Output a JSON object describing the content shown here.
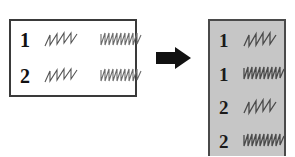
{
  "diagram": {
    "background_color": "#ffffff"
  },
  "source_box": {
    "name": "source-table",
    "fill_color": "#ffffff",
    "border_color": "#3a3a3a",
    "rows": [
      {
        "label": "1",
        "waveforms": [
          {
            "kind": "sawtooth-sparse",
            "cycles": 2.5,
            "stroke_color": "#555555"
          },
          {
            "kind": "sawtooth-dense",
            "cycles": 5,
            "stroke_color": "#6b6b6b"
          }
        ]
      },
      {
        "label": "2",
        "waveforms": [
          {
            "kind": "sawtooth-sparse",
            "cycles": 2.5,
            "stroke_color": "#555555"
          },
          {
            "kind": "sawtooth-dense",
            "cycles": 5,
            "stroke_color": "#6b6b6b"
          }
        ]
      }
    ]
  },
  "arrow": {
    "name": "right-arrow",
    "direction": "right",
    "color": "#111111"
  },
  "result_box": {
    "name": "result-table",
    "fill_color": "#c6c6c6",
    "border_color": "#4a4a4a",
    "rows": [
      {
        "label": "1",
        "waveform": {
          "kind": "sawtooth-sparse",
          "cycles": 2.5,
          "stroke_color": "#4a4a4a"
        }
      },
      {
        "label": "1",
        "waveform": {
          "kind": "sawtooth-dense",
          "cycles": 5,
          "stroke_color": "#4a4a4a"
        }
      },
      {
        "label": "2",
        "waveform": {
          "kind": "sawtooth-sparse",
          "cycles": 2.5,
          "stroke_color": "#4a4a4a"
        }
      },
      {
        "label": "2",
        "waveform": {
          "kind": "sawtooth-dense",
          "cycles": 5,
          "stroke_color": "#4a4a4a"
        }
      }
    ]
  }
}
